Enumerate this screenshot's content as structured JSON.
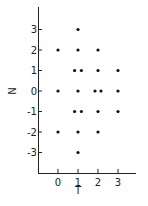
{
  "chart_data": {
    "type": "scatter",
    "title": "",
    "xlabel": "T",
    "ylabel": "N",
    "xlim": [
      -1,
      3.8
    ],
    "ylim": [
      -4,
      4
    ],
    "xticks": [
      0,
      1,
      2,
      3
    ],
    "yticks": [
      3,
      2,
      1,
      0,
      -1,
      -2,
      -3
    ],
    "xtick_labels": [
      "0",
      "1",
      "2",
      "3"
    ],
    "ytick_labels": [
      "3",
      "2",
      "1",
      "0",
      "-1",
      "-2",
      "-3"
    ],
    "grid": false,
    "legend": null,
    "marker_color": "#111111",
    "points": [
      {
        "T": 1,
        "N": 3,
        "offset": 0
      },
      {
        "T": 0,
        "N": 2,
        "offset": 0
      },
      {
        "T": 1,
        "N": 2,
        "offset": 0
      },
      {
        "T": 2,
        "N": 2,
        "offset": 0
      },
      {
        "T": 1,
        "N": 1,
        "offset": -0.17
      },
      {
        "T": 1,
        "N": 1,
        "offset": 0.17
      },
      {
        "T": 2,
        "N": 1,
        "offset": 0
      },
      {
        "T": 3,
        "N": 1,
        "offset": 0
      },
      {
        "T": 0,
        "N": 0,
        "offset": 0
      },
      {
        "T": 1,
        "N": 0,
        "offset": 0
      },
      {
        "T": 2,
        "N": 0,
        "offset": -0.15
      },
      {
        "T": 2,
        "N": 0,
        "offset": 0.15
      },
      {
        "T": 3,
        "N": 0,
        "offset": 0
      },
      {
        "T": 1,
        "N": -1,
        "offset": -0.17
      },
      {
        "T": 1,
        "N": -1,
        "offset": 0.17
      },
      {
        "T": 2,
        "N": -1,
        "offset": 0
      },
      {
        "T": 3,
        "N": -1,
        "offset": 0
      },
      {
        "T": 0,
        "N": -2,
        "offset": 0
      },
      {
        "T": 1,
        "N": -2,
        "offset": 0
      },
      {
        "T": 2,
        "N": -2,
        "offset": 0
      },
      {
        "T": 1,
        "N": -3,
        "offset": 0
      }
    ]
  }
}
